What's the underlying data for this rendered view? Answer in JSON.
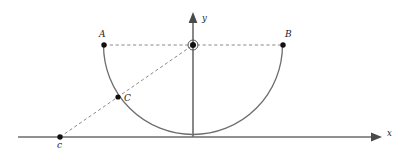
{
  "figure": {
    "type": "geometry-diagram",
    "width": 400,
    "height": 156,
    "background_color": "#ffffff"
  },
  "axes": {
    "x_axis": {
      "label": "x",
      "label_position": {
        "x": 387,
        "y": 129
      },
      "start": {
        "x": 18,
        "y": 137
      },
      "end": {
        "x": 381,
        "y": 137
      },
      "color": "#6b6b6b",
      "has_arrow": true
    },
    "y_axis": {
      "label": "y",
      "label_position": {
        "x": 202,
        "y": 14
      },
      "start": {
        "x": 193,
        "y": 137
      },
      "end": {
        "x": 193,
        "y": 13
      },
      "color": "#6b6b6b",
      "has_arrow": true
    }
  },
  "points": [
    {
      "id": "A",
      "label": "A",
      "x": 104,
      "y": 45,
      "label_position": {
        "x": 99,
        "y": 30
      },
      "marker": "filled-dot"
    },
    {
      "id": "B",
      "label": "B",
      "x": 283,
      "y": 45,
      "label_position": {
        "x": 285,
        "y": 30
      },
      "marker": "filled-dot"
    },
    {
      "id": "C",
      "label": "C",
      "x": 118,
      "y": 97,
      "label_position": {
        "x": 124,
        "y": 94
      },
      "marker": "filled-dot"
    },
    {
      "id": "c",
      "label": "c",
      "x": 60,
      "y": 137,
      "label_position": {
        "x": 57,
        "y": 141
      },
      "marker": "filled-dot"
    },
    {
      "id": "center",
      "label": "",
      "x": 193,
      "y": 45,
      "label_position": {
        "x": 193,
        "y": 45
      },
      "marker": "circled-dot"
    }
  ],
  "arc": {
    "name": "lower-semicircle",
    "center": {
      "x": 193,
      "y": 45
    },
    "radius": 89.5,
    "start": {
      "x": 103.5,
      "y": 45
    },
    "end": {
      "x": 282.5,
      "y": 45
    },
    "sweep": "lower-half",
    "color": "#6d6d6d"
  },
  "dashed_segments": [
    {
      "name": "chord-A-to-center-to-B",
      "from": {
        "x": 104,
        "y": 45
      },
      "to": {
        "x": 283,
        "y": 45
      }
    },
    {
      "name": "secant-c-through-C-to-center",
      "from": {
        "x": 60,
        "y": 137
      },
      "to": {
        "x": 193,
        "y": 45
      }
    }
  ],
  "colors": {
    "axis": "#6b6b6b",
    "curve": "#6d6d6d",
    "dashed": "#8a8a8a",
    "point": "#111111",
    "label": "#1a1a1a"
  }
}
